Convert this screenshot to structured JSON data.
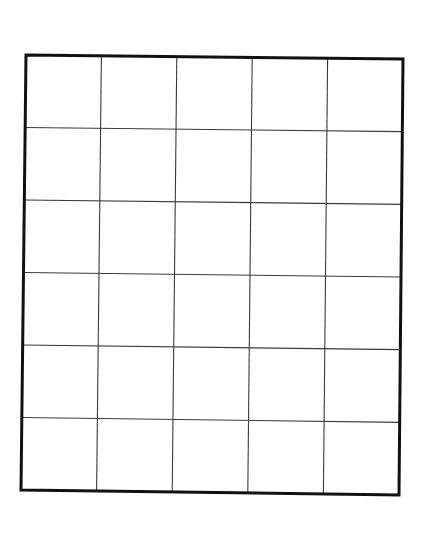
{
  "diagram": {
    "type": "grid",
    "columns": 5,
    "rows": 6,
    "corners": {
      "top_left": [
        26,
        55
      ],
      "top_right": [
        403,
        59
      ],
      "bottom_right": [
        399,
        495
      ],
      "bottom_left": [
        21,
        490
      ]
    },
    "colors": {
      "background": "#ffffff",
      "outer_border": "#111111",
      "inner_lines": "#3a3a3a"
    },
    "cells": []
  }
}
